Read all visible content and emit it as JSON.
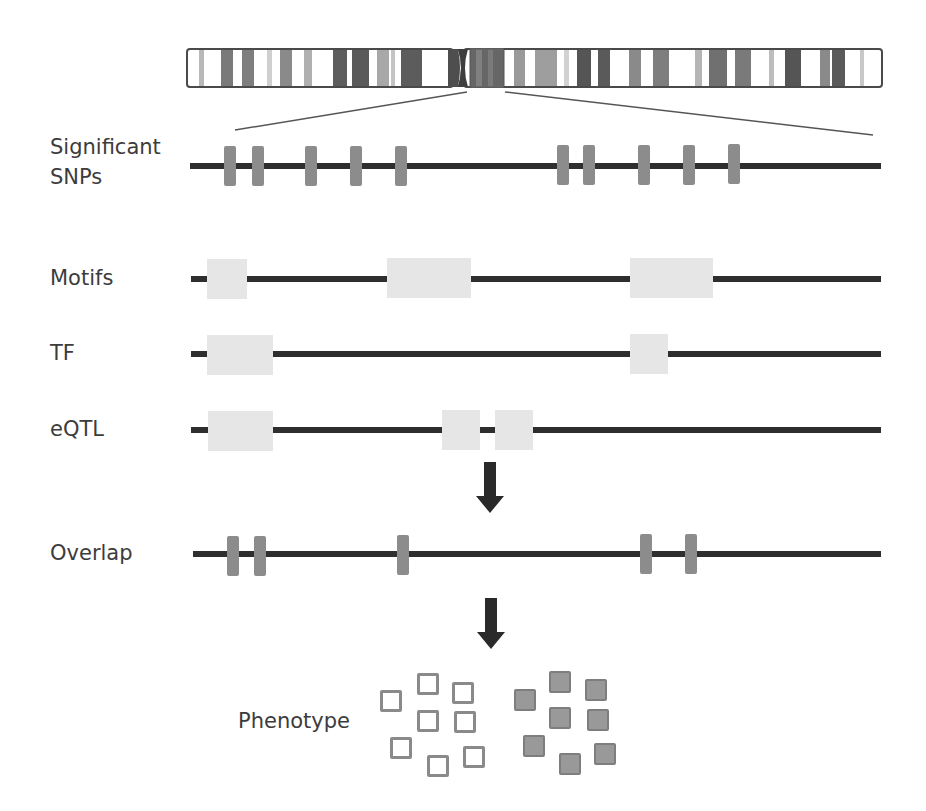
{
  "figure": {
    "type": "genomic annotation workflow",
    "colors": {
      "line": "#2e2e2e",
      "snp": "#8c8c8c",
      "region": "#e6e6e6",
      "band_dark": "#5a5a5a",
      "band_mid": "#8a8a8a",
      "band_light": "#b5b5b5",
      "arrow": "#2a2a2a"
    }
  },
  "chromosome": {
    "name": "chromosome-ideogram",
    "highlight_region_label": "zoomed region"
  },
  "tracks": {
    "snps": {
      "label": "Significant\nSNPs",
      "count": 10
    },
    "motifs": {
      "label": "Motifs",
      "count": 3
    },
    "tf": {
      "label": "TF",
      "count": 2
    },
    "eqtl": {
      "label": "eQTL",
      "count": 3
    },
    "overlap": {
      "label": "Overlap",
      "count": 5
    }
  },
  "arrows": [
    {
      "icon": "down-arrow-icon",
      "from": "eQTL",
      "to": "Overlap"
    },
    {
      "icon": "down-arrow-icon",
      "from": "Overlap",
      "to": "Phenotype"
    }
  ],
  "phenotype": {
    "label": "Phenotype",
    "groups": [
      {
        "name": "unaffected",
        "style": "open",
        "count": 8
      },
      {
        "name": "affected",
        "style": "filled",
        "count": 8
      }
    ]
  }
}
